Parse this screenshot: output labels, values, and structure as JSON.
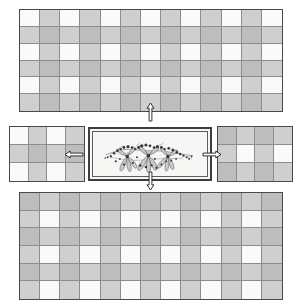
{
  "diagram": {
    "background_color": "#ffffff",
    "outline_color": "#4a4a4a",
    "grid_line_color": "#8d8d8d",
    "cell_colors": {
      "white": "#fafafa",
      "light_gray": "#cfcfcf",
      "dark_gray": "#bdbdbd"
    },
    "panels": [
      {
        "id": "top-panel",
        "name": "top-gingham-panel",
        "label": "Top gingham panel",
        "x": 19,
        "y": 9,
        "width": 264,
        "height": 103,
        "columns": 13,
        "rows": 6
      },
      {
        "id": "middle-left-panel",
        "name": "middle-left-gingham-block",
        "label": "Left gingham block",
        "x": 9,
        "y": 126,
        "width": 76,
        "height": 56,
        "columns": 4,
        "rows": 3,
        "phase": 0
      },
      {
        "id": "middle-right-panel",
        "name": "middle-right-gingham-block",
        "label": "Right gingham block",
        "x": 217,
        "y": 126,
        "width": 76,
        "height": 56,
        "columns": 4,
        "rows": 3,
        "phase": 1
      },
      {
        "id": "bottom-panel",
        "name": "bottom-gingham-panel",
        "label": "Bottom gingham panel",
        "x": 19,
        "y": 192,
        "width": 264,
        "height": 108,
        "columns": 13,
        "rows": 6,
        "phase": 1
      }
    ],
    "center_panel": {
      "id": "center-panel",
      "name": "center-embroidered-panel",
      "label": "Central embroidered floral panel",
      "x": 88,
      "y": 127,
      "width": 124,
      "height": 54,
      "border_color": "#3d3d3d",
      "inner_border_color": "#5c5c5c",
      "background": "#f6f6f4",
      "motif": {
        "name": "floral-spray-motif",
        "description": "Horizontal spray of three large lily flowers with trailing buds and berries",
        "flower_count": 3,
        "flower_fill": "#c9c9c9",
        "flower_stroke": "#4a4a4a",
        "bud_color": "#2b2b2b"
      }
    },
    "arrows": [
      {
        "id": "arrow-up",
        "name": "arrow-up-icon",
        "direction": "up",
        "x": 150,
        "y": 112,
        "length": 14
      },
      {
        "id": "arrow-down",
        "name": "arrow-down-icon",
        "direction": "down",
        "x": 150,
        "y": 181,
        "length": 14
      },
      {
        "id": "arrow-left",
        "name": "arrow-left-icon",
        "direction": "left",
        "x": 74,
        "y": 154,
        "length": 14
      },
      {
        "id": "arrow-right",
        "name": "arrow-right-icon",
        "direction": "right",
        "x": 212,
        "y": 154,
        "length": 14
      }
    ]
  }
}
